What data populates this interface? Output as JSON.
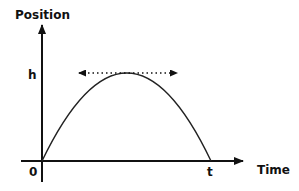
{
  "diagram": {
    "type": "position-time graph",
    "y_axis_label": "Position",
    "x_axis_label": "Time",
    "origin_label": "0",
    "peak_label": "h",
    "end_time_label": "t",
    "curve": "parabola (projectile)",
    "tangent_at_peak": "horizontal dotted double-headed arrow",
    "colors": {
      "axis": "#111111",
      "curve": "#222222",
      "tangent": "#111111",
      "background": "#ffffff"
    }
  }
}
